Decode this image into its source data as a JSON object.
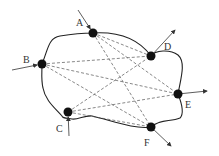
{
  "diagram": {
    "title": "",
    "colors": {
      "node": "#111111",
      "boundary": "#222222",
      "connection": "#555555",
      "arrow": "#333333",
      "label": "#333333"
    },
    "nodes": [
      {
        "id": "A",
        "label": "A",
        "x": 93,
        "y": 33,
        "flow": "in",
        "arrow_from": [
          78,
          10
        ],
        "label_pos": [
          76,
          26
        ]
      },
      {
        "id": "B",
        "label": "B",
        "x": 42,
        "y": 64,
        "flow": "in",
        "arrow_from": [
          12,
          70
        ],
        "label_pos": [
          23,
          63
        ]
      },
      {
        "id": "C",
        "label": "C",
        "x": 68,
        "y": 112,
        "flow": "in",
        "arrow_from": [
          69,
          136
        ],
        "label_pos": [
          56,
          132
        ]
      },
      {
        "id": "D",
        "label": "D",
        "x": 151,
        "y": 56,
        "flow": "out",
        "arrow_to": [
          175,
          30
        ],
        "label_pos": [
          164,
          50
        ]
      },
      {
        "id": "E",
        "label": "E",
        "x": 178,
        "y": 94,
        "flow": "out",
        "arrow_to": [
          207,
          91
        ],
        "label_pos": [
          185,
          108
        ]
      },
      {
        "id": "F",
        "label": "F",
        "x": 151,
        "y": 127,
        "flow": "out",
        "arrow_to": [
          171,
          146
        ],
        "label_pos": [
          144,
          146
        ]
      }
    ],
    "connections": [
      [
        "A",
        "D"
      ],
      [
        "A",
        "E"
      ],
      [
        "A",
        "F"
      ],
      [
        "B",
        "D"
      ],
      [
        "B",
        "E"
      ],
      [
        "B",
        "F"
      ],
      [
        "C",
        "D"
      ],
      [
        "C",
        "E"
      ],
      [
        "C",
        "F"
      ]
    ]
  }
}
